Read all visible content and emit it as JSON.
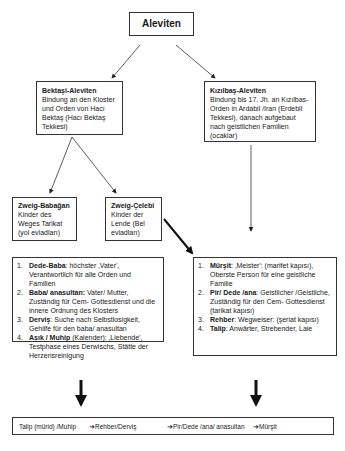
{
  "root": {
    "label": "Aleviten"
  },
  "branches": [
    {
      "title": "Bektaşi-Aleviten",
      "text": "Bindung an den Kloster und Orden von Hacı Bektaş (Hacı Bektaş Tekkesi)"
    },
    {
      "title": "Kızılbaş-Aleviten",
      "text": "Bindung bis 17. Jh. an Kızılbas-Orden in Ardabil /Iran (Erdebil Tekkesi), danach aufgebaut nach geistlichen Familien (ocaklar)"
    }
  ],
  "sub_branches": [
    {
      "title": "Zweig-Babağan",
      "text": "Kinder des Weges Tarikat (yol evladları)"
    },
    {
      "title": "Zweig-Çelebi",
      "text": "Kinder der Lende (Bel evladları)"
    }
  ],
  "left_list": [
    {
      "num": "1.",
      "term": "Dede-Baba",
      "desc": ": höchster ‚Vater', Verantwortlich für alle Orden und Familien"
    },
    {
      "num": "2.",
      "term": "Baba/ anasultan:",
      "desc": " Vater/ Mutter, Zuständig für Cem- Gottesdienst und die innere Ordnung des Klosters"
    },
    {
      "num": "3.",
      "term": "Derviş",
      "desc": ": Suche nach Selbstlosigkeit, Gehilfe für den baba/ anasultan"
    },
    {
      "num": "4.",
      "term": "Aşık / Muhip",
      "desc": " (Kalender): ‚Liebende', Testphase eines Derwischs, Stätte der Herzensreinigung"
    }
  ],
  "right_list": [
    {
      "num": "1.",
      "term": "Mürşit",
      "desc": ": ‚Meister': (marifet kapısı), Oberste Person für eine geistliche Familie"
    },
    {
      "num": "2.",
      "term": "Pir/ Dede /ana",
      "desc": ": Geistlicher /Geistliche, Zuständig für den Cem- Gottesdienst (tarikat kapısı)"
    },
    {
      "num": "3.",
      "term": "Rehber",
      "desc": ": Wegweiser: (şeriat kapısı)"
    },
    {
      "num": "4.",
      "term": "Talip",
      "desc": ": Anwärter, Strebender, Laie"
    }
  ],
  "path": {
    "steps": [
      "Talip (mürid) /Muhip",
      "➔Rehber/Derviş",
      "➔Pir/Dede /ana/ anasultan",
      "➔Mürşit"
    ]
  }
}
